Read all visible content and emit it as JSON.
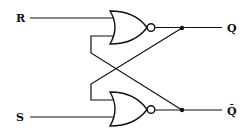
{
  "diagram": {
    "type": "SR latch (cross-coupled NOR gates)",
    "inputs": {
      "r_label": "R",
      "s_label": "S"
    },
    "outputs": {
      "q_label": "Q",
      "qbar_label": "Q̄"
    },
    "gates": [
      {
        "name": "NOR",
        "position": "top",
        "inputs": [
          "R",
          "Q̄ feedback"
        ],
        "output": "Q"
      },
      {
        "name": "NOR",
        "position": "bottom",
        "inputs": [
          "Q feedback",
          "S"
        ],
        "output": "Q̄"
      }
    ],
    "colors": {
      "line": "#111111",
      "background": "#ffffff"
    }
  }
}
